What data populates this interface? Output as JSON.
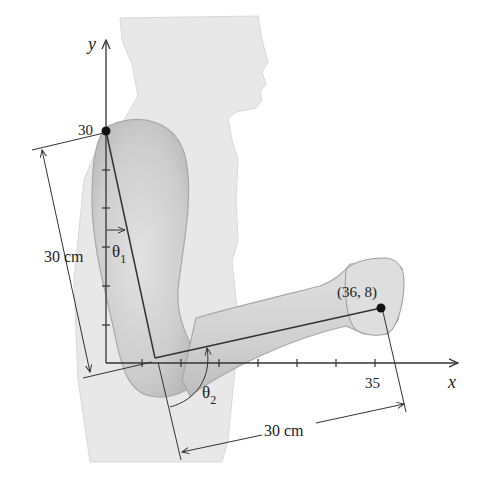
{
  "figure": {
    "axes": {
      "x_label": "x",
      "y_label": "y",
      "y_tick_label": "30",
      "x_tick_label": "35"
    },
    "points": {
      "shoulder_label": "30",
      "hand_label": "(36, 8)"
    },
    "angles": {
      "theta1": "θ",
      "theta1_sub": "1",
      "theta2": "θ",
      "theta2_sub": "2"
    },
    "dimensions": {
      "upper_arm": "30 cm",
      "forearm": "30 cm"
    },
    "colors": {
      "silhouette": "#e6e6e6",
      "arm_shade": "#cfcfcf",
      "line": "#333333",
      "background": "#ffffff"
    }
  }
}
